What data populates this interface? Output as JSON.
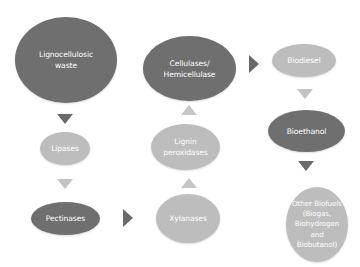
{
  "diagram": {
    "type": "flowchart",
    "colors": {
      "dark_node": "#6f6f6f",
      "light_node": "#bdbdbd",
      "text": "#ffffff"
    },
    "nodes": [
      {
        "id": "lignocellulosic_waste",
        "label": "Lignocellulosic\nwaste",
        "style": "dark"
      },
      {
        "id": "lipases",
        "label": "Lipases",
        "style": "light"
      },
      {
        "id": "pectinases",
        "label": "Pectinases",
        "style": "dark"
      },
      {
        "id": "xylanases",
        "label": "Xylanases",
        "style": "light"
      },
      {
        "id": "lignin_peroxidases",
        "label": "Lignin\nperoxidases",
        "style": "light"
      },
      {
        "id": "cellulases",
        "label": "Cellulases/\nHemicellulase",
        "style": "dark"
      },
      {
        "id": "biodiesel",
        "label": "Biodiesel",
        "style": "light"
      },
      {
        "id": "bioethanol",
        "label": "Bioethanol",
        "style": "dark"
      },
      {
        "id": "other_biofuels",
        "label": "Other Biofuels\n(Biogas,\nBiohydrogen\nand\nBiobutanol)",
        "style": "light"
      }
    ],
    "edges": [
      {
        "from": "lignocellulosic_waste",
        "to": "lipases",
        "direction": "down"
      },
      {
        "from": "lipases",
        "to": "pectinases",
        "direction": "down"
      },
      {
        "from": "pectinases",
        "to": "xylanases",
        "direction": "right"
      },
      {
        "from": "xylanases",
        "to": "lignin_peroxidases",
        "direction": "up"
      },
      {
        "from": "lignin_peroxidases",
        "to": "cellulases",
        "direction": "up"
      },
      {
        "from": "cellulases",
        "to": "biodiesel",
        "direction": "right"
      },
      {
        "from": "biodiesel",
        "to": "bioethanol",
        "direction": "down"
      },
      {
        "from": "bioethanol",
        "to": "other_biofuels",
        "direction": "down"
      }
    ]
  }
}
